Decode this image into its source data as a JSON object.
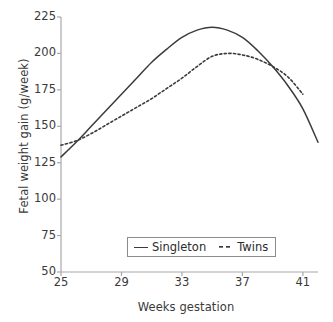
{
  "chart_data": {
    "type": "line",
    "title": "",
    "xlabel": "Weeks gestation",
    "ylabel": "Fetal weight gain (g/week)",
    "xlim": [
      25,
      42
    ],
    "ylim": [
      50,
      225
    ],
    "xticks": [
      25,
      29,
      33,
      37,
      41
    ],
    "yticks": [
      50,
      75,
      100,
      125,
      150,
      175,
      200,
      225
    ],
    "grid": false,
    "legend_position": "lower center",
    "series": [
      {
        "name": "Singleton",
        "style": "solid",
        "color": "#3b3b3b",
        "x": [
          25,
          26,
          27,
          28,
          29,
          30,
          31,
          32,
          33,
          34,
          35,
          36,
          37,
          38,
          39,
          40,
          41,
          42
        ],
        "values": [
          129,
          139,
          150,
          161,
          172,
          183,
          194,
          203,
          211,
          216,
          218,
          216,
          211,
          202,
          191,
          178,
          162,
          139
        ]
      },
      {
        "name": "Twins",
        "style": "dashed",
        "color": "#3b3b3b",
        "x": [
          25,
          26,
          27,
          28,
          29,
          30,
          31,
          32,
          33,
          34,
          35,
          36,
          37,
          38,
          39,
          40,
          41
        ],
        "values": [
          137,
          140,
          145,
          151,
          157,
          163,
          169,
          176,
          183,
          191,
          198,
          200,
          199,
          196,
          191,
          184,
          172
        ]
      }
    ]
  },
  "axes": {
    "ytick_labels": [
      "225",
      "200",
      "175",
      "150",
      "125",
      "100",
      "75",
      "50"
    ],
    "xtick_labels": [
      "25",
      "29",
      "33",
      "37",
      "41"
    ]
  },
  "legend": {
    "entries": [
      {
        "label": "Singleton"
      },
      {
        "label": "Twins"
      }
    ]
  }
}
